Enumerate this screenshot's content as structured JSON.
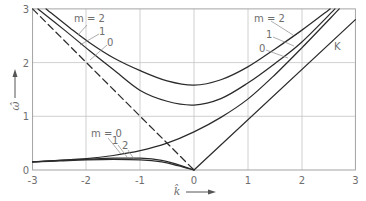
{
  "chart_data": {
    "type": "line",
    "title": "",
    "xlabel": "k̂",
    "ylabel": "ω̂",
    "xlim": [
      -3,
      3
    ],
    "ylim": [
      0,
      3
    ],
    "grid": true,
    "legend": "inline labels on curves",
    "xtick_labels": [
      "-3",
      "-2",
      "-1",
      "0",
      "1",
      "2",
      "3"
    ],
    "ytick_labels": [
      "0",
      "1",
      "2",
      "3"
    ],
    "xticks": [
      -3,
      -2,
      -1,
      0,
      1,
      2,
      3
    ],
    "yticks": [
      0,
      1,
      2,
      3
    ],
    "series": [
      {
        "name": "m = 2 (upper branch)",
        "style": "solid",
        "points": [
          [
            -2.75,
            3
          ],
          [
            -2.3,
            2.64
          ],
          [
            -1.94,
            2.37
          ],
          [
            -1.5,
            2.09
          ],
          [
            -1,
            1.85
          ],
          [
            -0.5,
            1.66
          ],
          [
            0,
            1.58
          ],
          [
            0.5,
            1.68
          ],
          [
            1,
            1.92
          ],
          [
            1.5,
            2.25
          ],
          [
            2,
            2.6
          ],
          [
            2.53,
            3
          ]
        ]
      },
      {
        "name": "m = 1 (upper branch)",
        "style": "solid",
        "points": [
          [
            -2.9,
            3
          ],
          [
            -2.4,
            2.6
          ],
          [
            -1.94,
            2.22
          ],
          [
            -1.5,
            1.87
          ],
          [
            -1,
            1.48
          ],
          [
            -0.5,
            1.28
          ],
          [
            0,
            1.21
          ],
          [
            0.5,
            1.33
          ],
          [
            1,
            1.62
          ],
          [
            1.5,
            1.98
          ],
          [
            2,
            2.38
          ],
          [
            2.62,
            3
          ]
        ]
      },
      {
        "name": "m = 0",
        "style": "solid",
        "points": [
          [
            -3,
            0.15
          ],
          [
            -2.5,
            0.18
          ],
          [
            -2,
            0.21
          ],
          [
            -1.5,
            0.27
          ],
          [
            -1,
            0.36
          ],
          [
            -0.5,
            0.5
          ],
          [
            0,
            0.71
          ],
          [
            0.5,
            0.98
          ],
          [
            1,
            1.32
          ],
          [
            1.5,
            1.77
          ],
          [
            2,
            2.27
          ],
          [
            2.7,
            3
          ]
        ]
      },
      {
        "name": "K",
        "style": "solid",
        "points": [
          [
            0,
            0
          ],
          [
            3,
            2.8
          ]
        ]
      },
      {
        "name": "dashed line",
        "style": "dashed",
        "points": [
          [
            -3,
            3
          ],
          [
            0,
            0
          ]
        ]
      },
      {
        "name": "m = 1 (lower branch)",
        "style": "solid",
        "points": [
          [
            -3,
            0.15
          ],
          [
            -2.5,
            0.18
          ],
          [
            -2,
            0.2
          ],
          [
            -1.5,
            0.22
          ],
          [
            -1,
            0.22
          ],
          [
            -0.6,
            0.18
          ],
          [
            -0.3,
            0.1
          ],
          [
            0,
            0
          ]
        ]
      },
      {
        "name": "m = 2 (lower branch)",
        "style": "solid",
        "points": [
          [
            -3,
            0.15
          ],
          [
            -2.5,
            0.17
          ],
          [
            -2,
            0.19
          ],
          [
            -1.5,
            0.2
          ],
          [
            -1,
            0.19
          ],
          [
            -0.6,
            0.15
          ],
          [
            -0.3,
            0.08
          ],
          [
            0,
            0
          ]
        ]
      }
    ],
    "annotations": {
      "upper_left": [
        "m = 2",
        "1",
        "0"
      ],
      "upper_right": [
        "m = 2",
        "1",
        "0",
        "K"
      ],
      "lower_left": [
        "m = 0",
        "1",
        "2"
      ]
    }
  }
}
